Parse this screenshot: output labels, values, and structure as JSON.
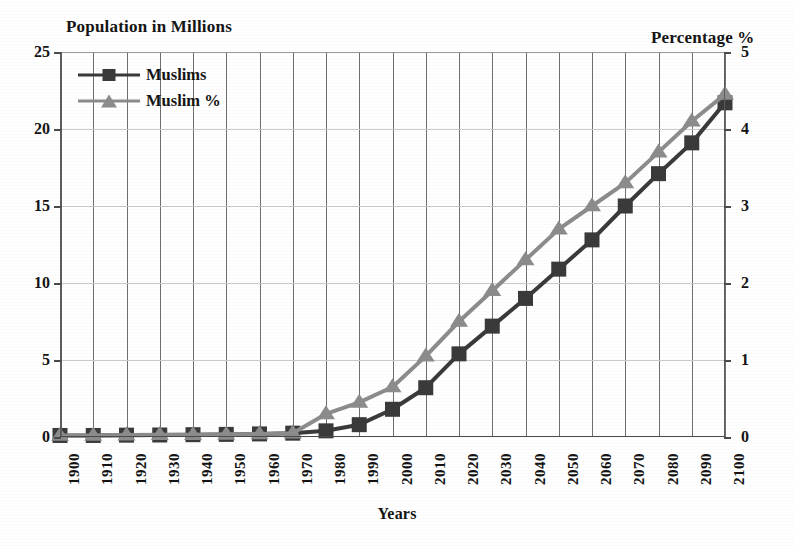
{
  "chart_data": {
    "type": "line",
    "title": "",
    "xlabel": "Years",
    "ylabel": "Population in Millions",
    "y2label": "Percentage %",
    "categories": [
      "1900",
      "1910",
      "1920",
      "1930",
      "1940",
      "1950",
      "1960",
      "1970",
      "1980",
      "1990",
      "2000",
      "2010",
      "2020",
      "2030",
      "2040",
      "2050",
      "2060",
      "2070",
      "2080",
      "2090",
      "2100"
    ],
    "ylim": [
      0,
      25
    ],
    "y2lim": [
      0,
      5
    ],
    "yticks": [
      "0",
      "5",
      "10",
      "15",
      "20",
      "25"
    ],
    "y2ticks": [
      "0",
      "1",
      "2",
      "3",
      "4",
      "5"
    ],
    "grid": "vertical-and-horizontal",
    "legend_position": "top-left-inside",
    "series": [
      {
        "name": "Muslims",
        "axis": "left",
        "units": "millions",
        "marker": "square",
        "color": "#3a3a3a",
        "values": [
          0.1,
          0.1,
          0.12,
          0.13,
          0.15,
          0.17,
          0.2,
          0.25,
          0.4,
          0.8,
          1.8,
          3.2,
          5.4,
          7.2,
          9.0,
          10.9,
          12.8,
          15.0,
          17.1,
          19.1,
          21.7
        ]
      },
      {
        "name": "Muslim %",
        "axis": "right",
        "units": "percent",
        "marker": "triangle",
        "color": "#8c8c8c",
        "values": [
          0.02,
          0.02,
          0.025,
          0.03,
          0.03,
          0.035,
          0.04,
          0.05,
          0.3,
          0.45,
          0.65,
          1.05,
          1.5,
          1.9,
          2.3,
          2.7,
          3.0,
          3.3,
          3.7,
          4.1,
          4.45
        ]
      }
    ]
  },
  "legend": {
    "items": [
      {
        "label": "Muslims",
        "marker": "square",
        "color": "#3a3a3a"
      },
      {
        "label": "Muslim %",
        "marker": "triangle",
        "color": "#8c8c8c"
      }
    ]
  },
  "axes": {
    "left_title": "Population in Millions",
    "right_title": "Percentage %",
    "x_title": "Years"
  },
  "colors": {
    "series_muslims": "#3a3a3a",
    "series_muslim_pct": "#8c8c8c",
    "grid": "#6f6f6f",
    "hgrid": "#c9c9c9",
    "axis": "#4a4a4a",
    "text": "#131313",
    "background": "#ffffff"
  }
}
